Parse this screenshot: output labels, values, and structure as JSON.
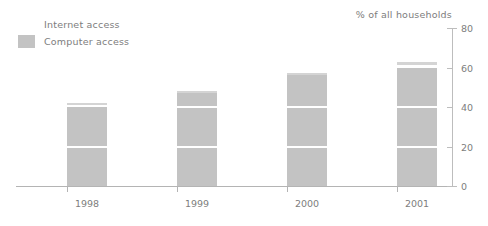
{
  "chart_data": {
    "type": "bar",
    "title": "",
    "subtitle": "",
    "xlabel": "",
    "ylabel": "% of all households",
    "categories": [
      "1998",
      "1999",
      "2000",
      "2001"
    ],
    "series": [
      {
        "name": "Internet access",
        "values": [
          42,
          48,
          57,
          63
        ],
        "color": "#d4d4d4"
      },
      {
        "name": "Computer access",
        "values": [
          40,
          48,
          56,
          60
        ],
        "color": "#c3c3c3"
      }
    ],
    "ylim": [
      0,
      80
    ],
    "yticks": [
      0,
      20,
      40,
      60,
      80
    ],
    "ytick_labels": [
      "0",
      "20",
      "40",
      "60",
      "80"
    ],
    "grid": "white gridlines drawn across bars at 20 and 40",
    "legend_position": "top-left",
    "axis_position": "right",
    "note": "Stacked appearance: thin Internet access strip sits above the Computer access bar"
  },
  "legend": {
    "items": [
      {
        "label": "Internet access",
        "swatch": "#ffffff",
        "swatch_visible": false
      },
      {
        "label": "Computer access",
        "swatch": "#c3c3c3",
        "swatch_visible": true
      }
    ]
  },
  "axis": {
    "title": "% of all households",
    "ticks": [
      {
        "label": "80",
        "value": 80
      },
      {
        "label": "60",
        "value": 60
      },
      {
        "label": "40",
        "value": 40
      },
      {
        "label": "20",
        "value": 20
      },
      {
        "label": "0",
        "value": 0
      }
    ]
  },
  "xaxis": {
    "labels": [
      "1998",
      "1999",
      "2000",
      "2001"
    ]
  },
  "colors": {
    "computer_access": "#c3c3c3",
    "internet_access": "#d4d4d4",
    "text": "#7d7d7d",
    "axis": "#b4b4b4",
    "background": "#ffffff"
  }
}
